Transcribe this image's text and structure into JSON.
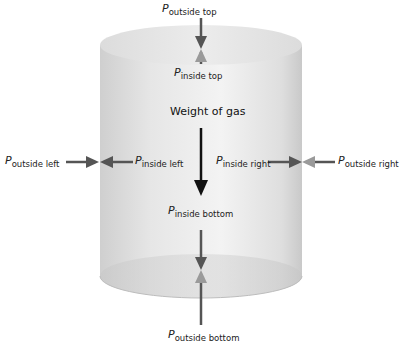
{
  "diagram": {
    "shape": "cylinder",
    "colors": {
      "cylinder_body": "#d9d9d9",
      "cylinder_highlight": "#f4f4f4",
      "pressure_arrow": "#555555",
      "inner_arrow_tip": "#9a9a9a",
      "weight_arrow": "#111111"
    },
    "labels": {
      "outside_top": {
        "symbol": "P",
        "subscript": "outside top"
      },
      "inside_top": {
        "symbol": "P",
        "subscript": "inside top"
      },
      "outside_left": {
        "symbol": "P",
        "subscript": "outside left"
      },
      "inside_left": {
        "symbol": "P",
        "subscript": "inside left"
      },
      "inside_right": {
        "symbol": "P",
        "subscript": "inside right"
      },
      "outside_right": {
        "symbol": "P",
        "subscript": "outside right"
      },
      "inside_bottom": {
        "symbol": "P",
        "subscript": "inside bottom"
      },
      "outside_bottom": {
        "symbol": "P",
        "subscript": "outside bottom"
      },
      "weight": "Weight of gas"
    }
  }
}
